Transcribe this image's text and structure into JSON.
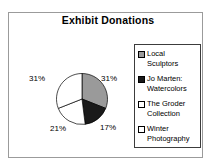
{
  "title": "Exhibit Donations",
  "legend": {
    "items": [
      {
        "label": "Local Sculptors",
        "color": "#9a9a9a"
      },
      {
        "label": "Jo Marten: Watercolors",
        "color": "#1a1a1a"
      },
      {
        "label": "The Groder Collection",
        "color": "#ffffff"
      },
      {
        "label": "Winter Photography",
        "color": "#ffffff"
      }
    ]
  },
  "chart_data": {
    "type": "pie",
    "title": "Exhibit Donations",
    "labels": [
      "Local Sculptors",
      "Jo Marten: Watercolors",
      "The Groder Collection",
      "Winter Photography"
    ],
    "values_percent": [
      31,
      17,
      21,
      31
    ],
    "colors": [
      "#9a9a9a",
      "#1a1a1a",
      "#ffffff",
      "#ffffff"
    ],
    "data_labels": [
      "31%",
      "17%",
      "21%",
      "31%"
    ],
    "legend_position": "right",
    "start_angle_deg": 0,
    "direction": "clockwise",
    "outline_color": "#000000",
    "background": "#ffffff"
  }
}
